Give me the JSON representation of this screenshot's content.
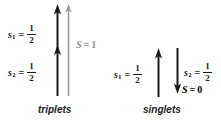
{
  "figure": {
    "panels": [
      {
        "id": "triplets",
        "caption": "triplets",
        "spin_labels": [
          {
            "symbol": "s",
            "subscript": "1",
            "equals": "=",
            "numerator": "1",
            "denominator": "2"
          },
          {
            "symbol": "s",
            "subscript": "2",
            "equals": "=",
            "numerator": "1",
            "denominator": "2"
          }
        ],
        "total_spin": {
          "symbol": "S",
          "equals": "=",
          "value": "1",
          "color": "#8f8f8f"
        },
        "arrows": [
          {
            "name": "spin-1-arrow-up",
            "direction": "up",
            "color": "#1a1a1a"
          },
          {
            "name": "spin-2-arrow-up",
            "direction": "up",
            "color": "#1a1a1a"
          },
          {
            "name": "total-spin-arrow-up",
            "direction": "up",
            "color": "#9a9a9a"
          }
        ]
      },
      {
        "id": "singlets",
        "caption": "singlets",
        "spin_labels": [
          {
            "symbol": "s",
            "subscript": "1",
            "equals": "=",
            "numerator": "1",
            "denominator": "2"
          },
          {
            "symbol": "s",
            "subscript": "2",
            "equals": "=",
            "numerator": "1",
            "denominator": "2"
          }
        ],
        "total_spin": {
          "symbol": "S",
          "equals": "=",
          "value": "0",
          "color": "#1a1a1a"
        },
        "arrows": [
          {
            "name": "spin-1-arrow-up",
            "direction": "up",
            "color": "#1a1a1a"
          },
          {
            "name": "spin-2-arrow-down",
            "direction": "down",
            "color": "#1a1a1a"
          }
        ]
      }
    ],
    "colors": {
      "ink": "#1a1a1a",
      "gray": "#8f8f8f",
      "gray_arrow": "#9a9a9a",
      "background": "#ffffff"
    }
  }
}
